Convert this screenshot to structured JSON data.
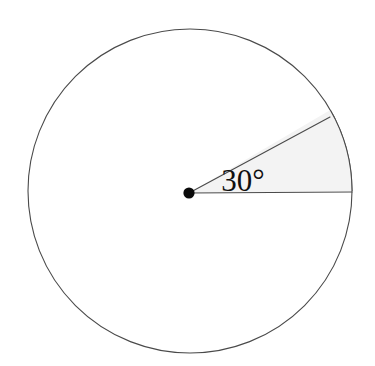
{
  "figure": {
    "name": "circle-with-30-degree-sector",
    "background_color": "#ffffff",
    "width": 375,
    "height": 366
  },
  "chart_data": {
    "type": "pie",
    "title": "",
    "subtitle": "",
    "xlabel": "",
    "ylabel": "",
    "legend": [],
    "categories": [
      "shaded sector",
      "unshaded remainder"
    ],
    "values": [
      30,
      330
    ],
    "units": "degrees",
    "total_degrees": 360,
    "annotations": [
      {
        "name": "angle-measure",
        "text": "30°",
        "value": 30,
        "units": "degrees",
        "x": 243,
        "y": 184
      }
    ]
  },
  "circle": {
    "center_x": 190,
    "center_y": 191,
    "radius": 162,
    "stroke_color": "#4a4a4a",
    "stroke_width": 1.1,
    "fill_color": "#ffffff"
  },
  "center_point": {
    "label": "center-dot",
    "x": 189,
    "y": 193,
    "radius": 5.6,
    "color": "#0a0a0a"
  },
  "sector": {
    "label": "shaded-sector",
    "start_angle_deg": 0,
    "end_angle_deg": 30,
    "fill_color": "#f3f3f3",
    "stroke_color": "#4a4a4a",
    "stroke_width": 1.1
  },
  "radii": [
    {
      "name": "horizontal-radius",
      "angle_deg": 0,
      "from_x": 189,
      "from_y": 193,
      "to_x": 352,
      "to_y": 192,
      "stroke_color": "#4a4a4a",
      "stroke_width": 1.1
    },
    {
      "name": "angled-radius",
      "angle_deg": 30,
      "from_x": 189,
      "from_y": 193,
      "to_x": 330,
      "to_y": 117,
      "stroke_color": "#4a4a4a",
      "stroke_width": 1.1
    }
  ],
  "angle_label": {
    "name": "angle-label",
    "text": "30°",
    "x": 243,
    "y": 191,
    "font_size": 31,
    "color": "#101010"
  }
}
